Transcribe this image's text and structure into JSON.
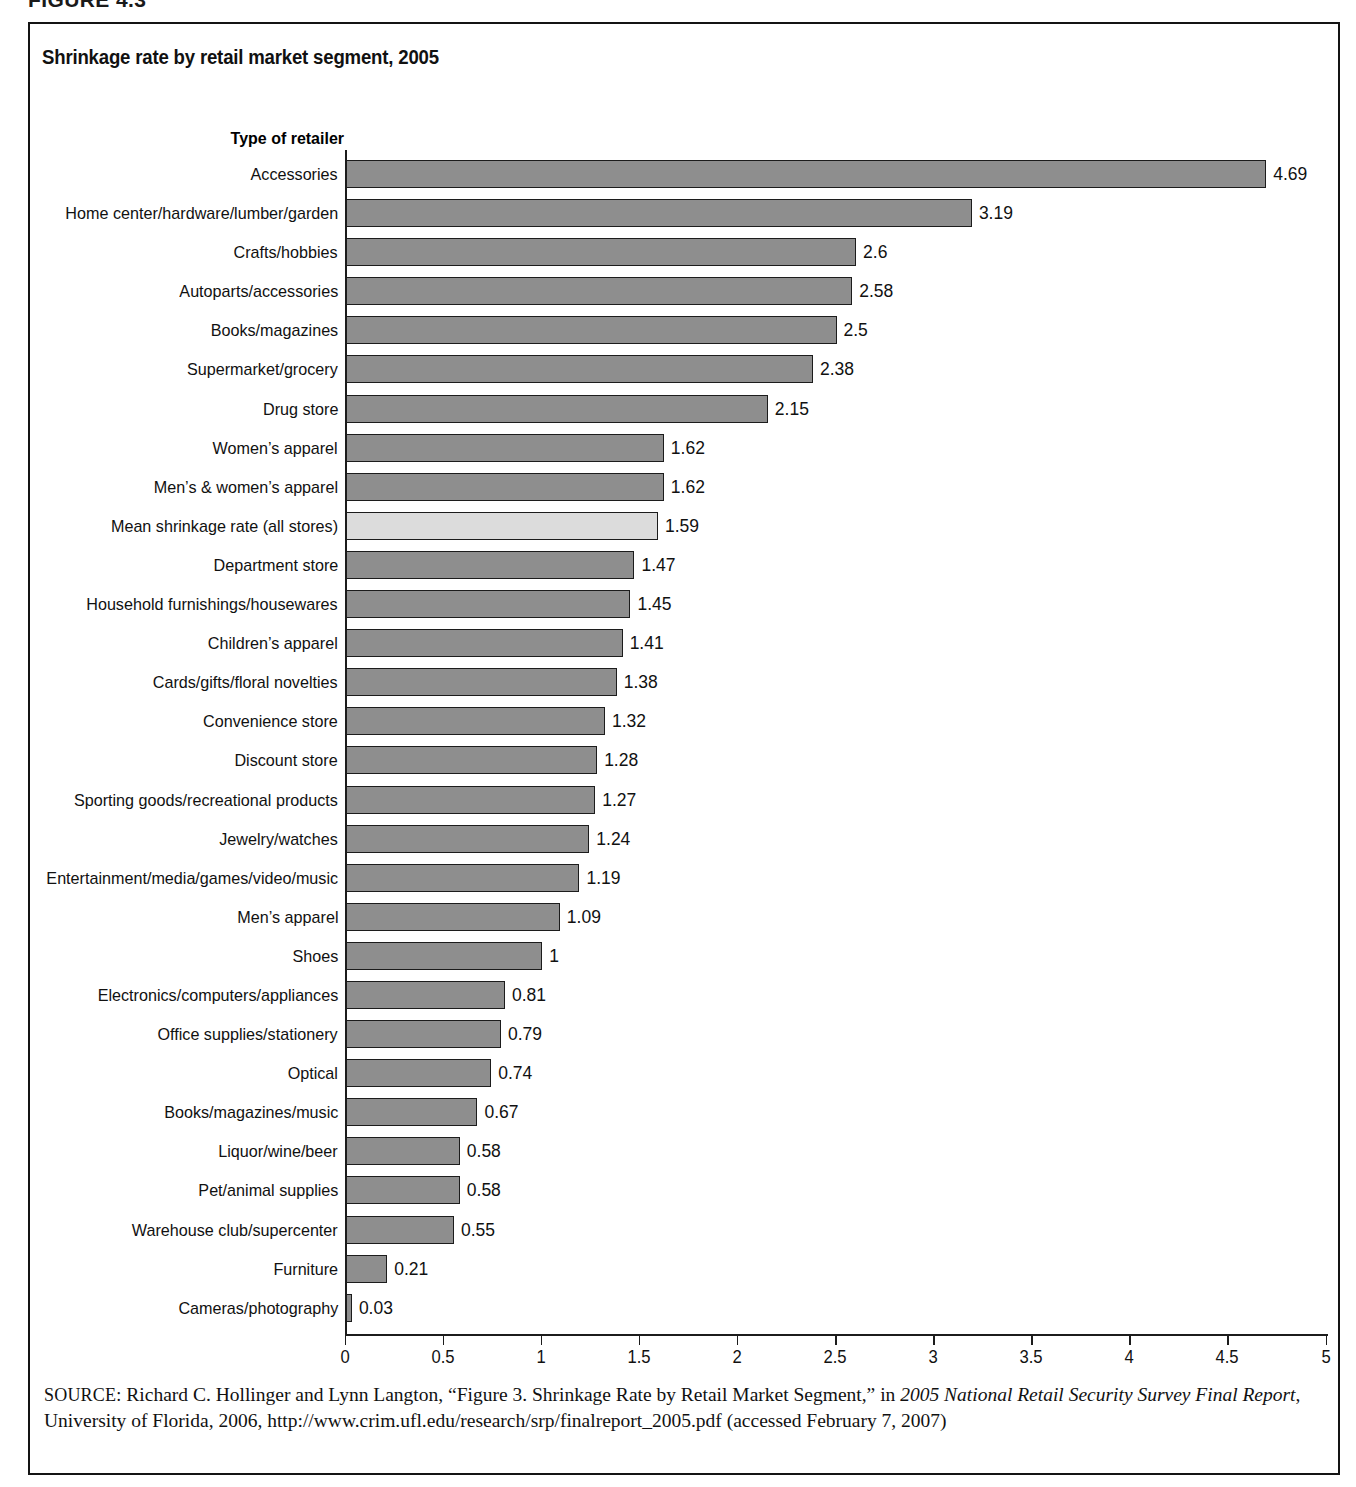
{
  "figure": {
    "number_label": "FIGURE 4.3"
  },
  "chart": {
    "title": "Shrinkage rate by retail market segment, 2005",
    "category_axis_header": "Type of retailer"
  },
  "source": {
    "label": "SOURCE:",
    "text_part1": " Richard C. Hollinger and Lynn Langton, “Figure 3. Shrinkage Rate by Retail Market Segment,” in ",
    "italic1": "2005 National Retail Security Survey Final Report",
    "text_part2": ", University of Florida, 2006, http://www.crim.ufl.edu/research/srp/finalreport_2005.pdf (accessed February 7, 2007)"
  },
  "chart_data": {
    "type": "bar",
    "orientation": "horizontal",
    "title": "Shrinkage rate by retail market segment, 2005",
    "xlabel": "",
    "ylabel": "Type of retailer",
    "xlim": [
      0,
      5
    ],
    "xticks": [
      "0",
      "0.5",
      "1",
      "1.5",
      "2",
      "2.5",
      "3",
      "3.5",
      "4",
      "4.5",
      "5"
    ],
    "xtick_values": [
      0,
      0.5,
      1,
      1.5,
      2,
      2.5,
      3,
      3.5,
      4,
      4.5,
      5
    ],
    "grid": false,
    "legend": "none",
    "bar_color": "#8e8e8e",
    "highlight_color": "#dcdcdc",
    "categories": [
      "Accessories",
      "Home center/hardware/lumber/garden",
      "Crafts/hobbies",
      "Autoparts/accessories",
      "Books/magazines",
      "Supermarket/grocery",
      "Drug store",
      "Women’s apparel",
      "Men’s & women’s apparel",
      "Mean shrinkage rate (all stores)",
      "Department store",
      "Household furnishings/housewares",
      "Children’s apparel",
      "Cards/gifts/floral novelties",
      "Convenience store",
      "Discount store",
      "Sporting goods/recreational products",
      "Jewelry/watches",
      "Entertainment/media/games/video/music",
      "Men’s apparel",
      "Shoes",
      "Electronics/computers/appliances",
      "Office supplies/stationery",
      "Optical",
      "Books/magazines/music",
      "Liquor/wine/beer",
      "Pet/animal supplies",
      "Warehouse club/supercenter",
      "Furniture",
      "Cameras/photography"
    ],
    "values": [
      4.69,
      3.19,
      2.6,
      2.58,
      2.5,
      2.38,
      2.15,
      1.62,
      1.62,
      1.59,
      1.47,
      1.45,
      1.41,
      1.38,
      1.32,
      1.28,
      1.27,
      1.24,
      1.19,
      1.09,
      1,
      0.81,
      0.79,
      0.74,
      0.67,
      0.58,
      0.58,
      0.55,
      0.21,
      0.03
    ],
    "value_labels": [
      "4.69",
      "3.19",
      "2.6",
      "2.58",
      "2.5",
      "2.38",
      "2.15",
      "1.62",
      "1.62",
      "1.59",
      "1.47",
      "1.45",
      "1.41",
      "1.38",
      "1.32",
      "1.28",
      "1.27",
      "1.24",
      "1.19",
      "1.09",
      "1",
      "0.81",
      "0.79",
      "0.74",
      "0.67",
      "0.58",
      "0.58",
      "0.55",
      "0.21",
      "0.03"
    ],
    "highlighted_categories": [
      "Mean shrinkage rate (all stores)"
    ]
  }
}
